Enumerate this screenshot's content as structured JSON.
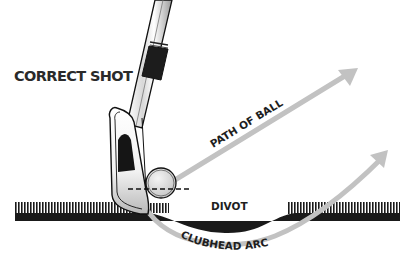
{
  "diagram": {
    "title": "CORRECT SHOT",
    "labels": {
      "path_of_ball": "PATH OF BALL",
      "divot": "DIVOT",
      "clubhead_arc": "CLUBHEAD ARC"
    },
    "elements": [
      "golf-club-shaft",
      "club-grip",
      "clubhead",
      "golf-ball",
      "ball-center-line",
      "grass-turf",
      "divot",
      "ball-path-arrow",
      "clubhead-arc-arrow"
    ],
    "colors": {
      "arrow": "#bdbdbd",
      "ground": "#1a1a1a",
      "text": "#222222",
      "background": "#ffffff"
    }
  }
}
